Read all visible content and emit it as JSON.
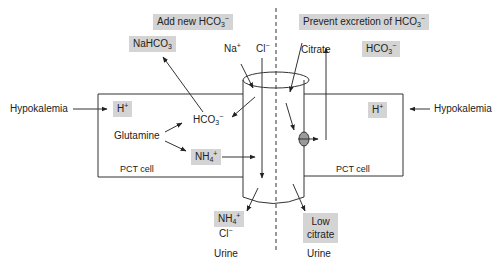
{
  "diagram": {
    "header_left": {
      "text": "Add new HCO",
      "sub": "3",
      "sup": "−"
    },
    "header_right": {
      "text": "Prevent excretion of HCO",
      "sub": "3",
      "sup": "−"
    },
    "left_cell": {
      "label": "PCT cell",
      "stimulus": "Hypokalemia",
      "h_ion": {
        "text": "H",
        "sup": "+"
      },
      "substrate": "Glutamine",
      "bicarb": {
        "text": "HCO",
        "sub": "3",
        "sup": "−"
      },
      "ammonium": {
        "text": "NH",
        "sub": "4",
        "sup": "+"
      },
      "output_box": {
        "text": "NaHCO",
        "sub": "3"
      }
    },
    "right_cell": {
      "label": "PCT cell",
      "stimulus": "Hypokalemia",
      "h_ion": {
        "text": "H",
        "sup": "+"
      },
      "citrate": "Citrate",
      "bicarb_box": {
        "text": "HCO",
        "sub": "3",
        "sup": "−"
      }
    },
    "tubule": {
      "na": {
        "text": "Na",
        "sup": "+"
      },
      "cl": {
        "text": "Cl",
        "sup": "−"
      }
    },
    "urine_left": {
      "nh4": {
        "text": "NH",
        "sub": "4",
        "sup": "+"
      },
      "cl": {
        "text": "Cl",
        "sup": "−"
      },
      "label": "Urine"
    },
    "urine_right": {
      "line1": "Low",
      "line2": "citrate",
      "label": "Urine"
    },
    "colors": {
      "box_fill": "#d4d4d4",
      "line": "#222222"
    }
  }
}
